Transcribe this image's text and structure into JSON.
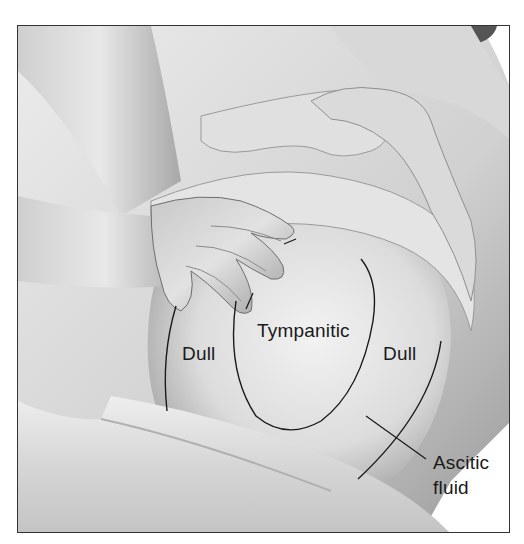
{
  "figure": {
    "labels": {
      "dull_left": "Dull",
      "tympanitic": "Tympanitic",
      "dull_right": "Dull",
      "ascitic_line1": "Ascitic",
      "ascitic_line2": "fluid"
    },
    "regions": [
      {
        "name": "dull-left",
        "label": "Dull"
      },
      {
        "name": "tympanitic",
        "label": "Tympanitic"
      },
      {
        "name": "dull-right",
        "label": "Dull"
      }
    ],
    "annotation": {
      "label": "Ascitic fluid",
      "points_to": "outer fluid boundary line"
    },
    "colors": {
      "border": "#333333",
      "outline": "#1a1a1a",
      "background": "#ffffff",
      "skin_light": "#e6e6e6",
      "skin_mid": "#bdbdbd",
      "skin_dark": "#8a8a8a"
    }
  }
}
